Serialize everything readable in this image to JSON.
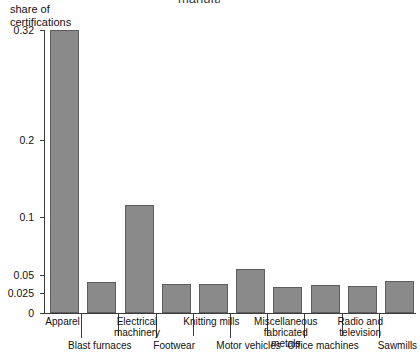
{
  "figure": {
    "top_cut_text": "manufacturing",
    "y_axis_title": "share of\ncertifications"
  },
  "chart_data": {
    "type": "bar",
    "title": "",
    "subtitle": "",
    "xlabel": "",
    "ylabel": "share of certifications",
    "grid": false,
    "legend": "none",
    "y_scale": "nonlinear (compressed at top)",
    "ylim": [
      0,
      0.32
    ],
    "ytick_labels": [
      "0",
      "0.025",
      "0.05",
      "0.1",
      "0.2",
      "0.32"
    ],
    "yticks": [
      0,
      0.025,
      0.05,
      0.1,
      0.2,
      0.32
    ],
    "categories": [
      "Apparel",
      "Blast furnaces",
      "Electrical machinery",
      "Footwear",
      "Knitting mills",
      "Motor vehicles",
      "Miscellaneous fabricated metals",
      "Office machines",
      "Radio and television",
      "Sawmills"
    ],
    "values": [
      0.32,
      0.04,
      0.115,
      0.037,
      0.037,
      0.055,
      0.033,
      0.036,
      0.035,
      0.042
    ],
    "bar_color": "#8a8a8a",
    "bar_edge_color": "#5d5d5d"
  },
  "x_label_rows": {
    "top_row": [
      "Apparel",
      "Electrical\nmachinery",
      "Knitting mills",
      "Miscellaneous\nfabricated metals",
      "Radio and\ntelevision"
    ],
    "bottom_row": [
      "Blast furnaces",
      "Footwear",
      "Motor vehicles",
      "Office machines",
      "Sawmills"
    ]
  }
}
